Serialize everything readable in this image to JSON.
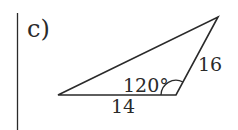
{
  "part_label": "c)",
  "triangle": {
    "sides": [
      {
        "name": "bottom",
        "label": "14"
      },
      {
        "name": "right",
        "label": "16"
      },
      {
        "name": "top",
        "label": ""
      }
    ],
    "angle": {
      "label": "120°",
      "vertex": "bottom-right"
    }
  },
  "colors": {
    "stroke": "#2a2a2a",
    "text": "#2a2a2a",
    "background": "#ffffff"
  }
}
